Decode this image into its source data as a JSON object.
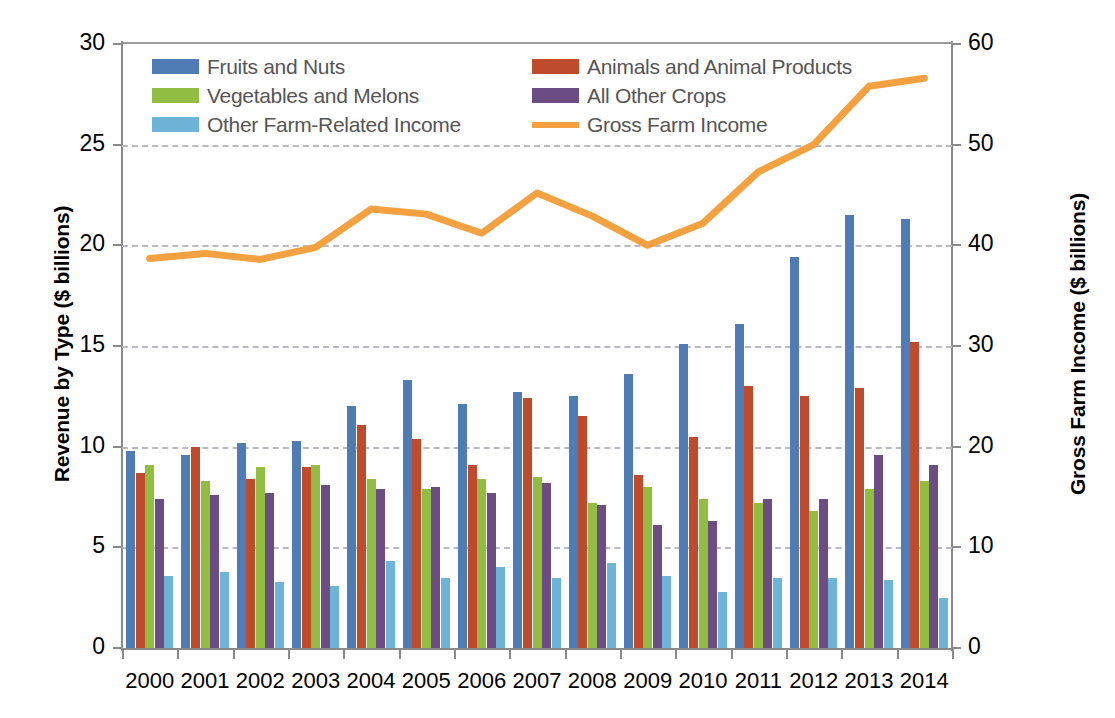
{
  "chart_data": {
    "type": "bar",
    "title": "",
    "xlabel": "",
    "ylabel": "Revenue by Type ($ billions)",
    "y2label": "Gross Farm Income ($ billions)",
    "categories": [
      "2000",
      "2001",
      "2002",
      "2003",
      "2004",
      "2005",
      "2006",
      "2007",
      "2008",
      "2009",
      "2010",
      "2011",
      "2012",
      "2013",
      "2014"
    ],
    "ylim": [
      0,
      30
    ],
    "yticks": [
      0,
      5,
      10,
      15,
      20,
      25,
      30
    ],
    "y2lim": [
      0,
      60
    ],
    "y2ticks": [
      0,
      10,
      20,
      30,
      40,
      50,
      60
    ],
    "grid": true,
    "legend_position": "top-inside",
    "series": [
      {
        "name": "Fruits and Nuts",
        "kind": "bar",
        "axis": "left",
        "color": "#4f7cb5",
        "values": [
          9.8,
          9.6,
          10.2,
          10.3,
          12.0,
          13.3,
          12.1,
          12.7,
          12.5,
          13.6,
          15.1,
          16.1,
          19.4,
          21.5,
          21.3
        ]
      },
      {
        "name": "Animals and Animal Products",
        "kind": "bar",
        "axis": "left",
        "color": "#be4b2b",
        "values": [
          8.7,
          10.0,
          8.4,
          9.0,
          11.1,
          10.4,
          9.1,
          12.4,
          11.5,
          8.6,
          10.5,
          13.0,
          12.5,
          12.9,
          15.2
        ]
      },
      {
        "name": "Vegetables and Melons",
        "kind": "bar",
        "axis": "left",
        "color": "#90bd42",
        "values": [
          9.1,
          8.3,
          9.0,
          9.1,
          8.4,
          7.9,
          8.4,
          8.5,
          7.2,
          8.0,
          7.4,
          7.2,
          6.8,
          7.9,
          8.3
        ]
      },
      {
        "name": "All Other Crops",
        "kind": "bar",
        "axis": "left",
        "color": "#6b4d83",
        "values": [
          7.4,
          7.6,
          7.7,
          8.1,
          7.9,
          8.0,
          7.7,
          8.2,
          7.1,
          6.1,
          6.3,
          7.4,
          7.4,
          9.6,
          9.1
        ]
      },
      {
        "name": "Other Farm-Related Income",
        "kind": "bar",
        "axis": "left",
        "color": "#6eb4d8",
        "values": [
          3.6,
          3.8,
          3.3,
          3.1,
          4.3,
          3.5,
          4.0,
          3.5,
          4.2,
          3.6,
          2.8,
          3.5,
          3.5,
          3.4,
          2.5
        ]
      },
      {
        "name": "Gross Farm Income",
        "kind": "line",
        "axis": "right",
        "color": "#f4a142",
        "values": [
          38.7,
          39.2,
          38.6,
          39.8,
          43.6,
          43.1,
          41.2,
          45.2,
          42.9,
          40.0,
          42.2,
          47.3,
          50.0,
          55.8,
          56.6
        ]
      }
    ]
  },
  "legend": {
    "col1": [
      {
        "label": "Fruits and Nuts",
        "color": "#4f7cb5",
        "kind": "bar"
      },
      {
        "label": "Vegetables and Melons",
        "color": "#90bd42",
        "kind": "bar"
      },
      {
        "label": "Other Farm-Related Income",
        "color": "#6eb4d8",
        "kind": "bar"
      }
    ],
    "col2": [
      {
        "label": "Animals and Animal Products",
        "color": "#be4b2b",
        "kind": "bar"
      },
      {
        "label": "All Other Crops",
        "color": "#6b4d83",
        "kind": "bar"
      },
      {
        "label": "Gross Farm Income",
        "color": "#f4a142",
        "kind": "line"
      }
    ]
  }
}
